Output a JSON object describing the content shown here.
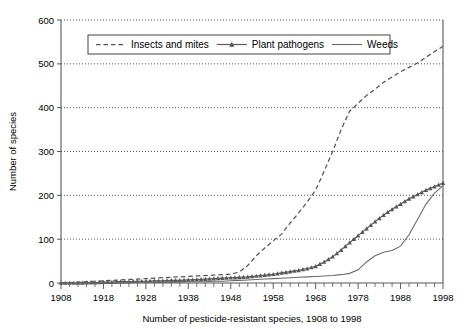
{
  "chart_data": {
    "type": "line",
    "title": "",
    "xlabel": "Number of pesticide-resistant species, 1908 to 1998",
    "ylabel": "Number of species",
    "xlim": [
      1908,
      1998
    ],
    "ylim": [
      0,
      600
    ],
    "grid": true,
    "legend_position": "top-center",
    "xticks": [
      "1908",
      "1918",
      "1928",
      "1938",
      "1948",
      "1958",
      "1968",
      "1978",
      "1988",
      "1998"
    ],
    "xtick_values": [
      1908,
      1918,
      1928,
      1938,
      1948,
      1958,
      1968,
      1978,
      1988,
      1998
    ],
    "yticks": [
      "0",
      "100",
      "200",
      "300",
      "400",
      "500",
      "600"
    ],
    "ytick_values": [
      0,
      100,
      200,
      300,
      400,
      500,
      600
    ],
    "x": [
      1908,
      1910,
      1912,
      1914,
      1916,
      1918,
      1920,
      1922,
      1924,
      1926,
      1928,
      1930,
      1932,
      1934,
      1936,
      1938,
      1940,
      1942,
      1944,
      1946,
      1948,
      1950,
      1952,
      1954,
      1956,
      1958,
      1960,
      1962,
      1964,
      1966,
      1968,
      1970,
      1972,
      1974,
      1976,
      1978,
      1980,
      1982,
      1984,
      1986,
      1988,
      1990,
      1992,
      1994,
      1996,
      1998
    ],
    "series": [
      {
        "name": "Insects and mites",
        "style": "dashed",
        "marker": "none",
        "color": "#545454",
        "values": [
          0,
          1,
          2,
          3,
          4,
          5,
          6,
          7,
          8,
          9,
          10,
          11,
          12,
          13,
          14,
          15,
          16,
          17,
          18,
          19,
          20,
          25,
          40,
          62,
          80,
          96,
          112,
          137,
          160,
          185,
          212,
          255,
          300,
          350,
          392,
          410,
          428,
          442,
          458,
          470,
          482,
          492,
          502,
          515,
          528,
          540
        ]
      },
      {
        "name": "Plant pathogens",
        "style": "solid",
        "marker": "triangle",
        "color": "#5a5a5a",
        "values": [
          0,
          0,
          0,
          1,
          1,
          2,
          2,
          3,
          3,
          4,
          4,
          5,
          5,
          6,
          6,
          7,
          8,
          9,
          10,
          11,
          12,
          13,
          14,
          16,
          18,
          20,
          23,
          26,
          29,
          33,
          38,
          48,
          60,
          75,
          92,
          108,
          124,
          140,
          155,
          168,
          180,
          192,
          202,
          212,
          220,
          228
        ]
      },
      {
        "name": "Weeds",
        "style": "solid",
        "marker": "none",
        "color": "#6a6a6a",
        "values": [
          0,
          0,
          0,
          0,
          0,
          0,
          0,
          1,
          1,
          1,
          1,
          2,
          2,
          2,
          2,
          3,
          3,
          3,
          4,
          4,
          5,
          6,
          7,
          8,
          9,
          10,
          11,
          12,
          13,
          14,
          15,
          16,
          17,
          19,
          22,
          30,
          48,
          62,
          70,
          74,
          84,
          110,
          145,
          180,
          205,
          222
        ]
      }
    ]
  },
  "legend": {
    "items": [
      {
        "label": "Insects and mites",
        "swatch": "dashed-line"
      },
      {
        "label": "Plant pathogens",
        "swatch": "line-with-triangle-marker"
      },
      {
        "label": "Weeds",
        "swatch": "solid-line"
      }
    ]
  }
}
